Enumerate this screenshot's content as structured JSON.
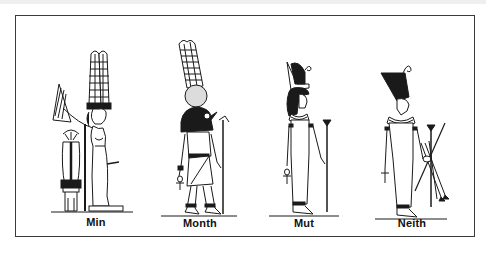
{
  "plate": {
    "border_color": "#3a3a3a",
    "ink_color": "#1a1a1a",
    "background": "#ffffff"
  },
  "figures": [
    {
      "name": "Min",
      "attributes": [
        "tall double-plumed crown",
        "raised flail",
        "lotus shrine offering stand"
      ]
    },
    {
      "name": "Month",
      "attributes": [
        "falcon head",
        "sun disk",
        "double plumes",
        "ankh",
        "was-sceptre"
      ]
    },
    {
      "name": "Mut",
      "attributes": [
        "double crown",
        "vulture headdress",
        "ankh",
        "papyrus sceptre"
      ]
    },
    {
      "name": "Neith",
      "attributes": [
        "red crown of Lower Egypt",
        "bow and arrows",
        "papyrus sceptre",
        "ankh"
      ]
    }
  ]
}
